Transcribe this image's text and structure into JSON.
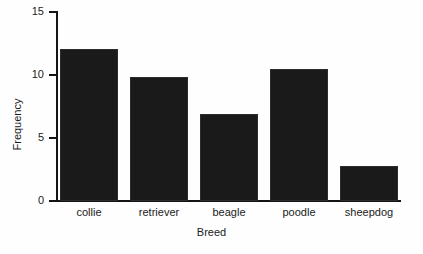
{
  "chart_data": {
    "type": "bar",
    "title": "",
    "xlabel": "Breed",
    "ylabel": "Frequency",
    "categories": [
      "collie",
      "retriever",
      "beagle",
      "poodle",
      "sheepdog"
    ],
    "values": [
      12,
      9.8,
      6.9,
      10.4,
      2.8
    ],
    "ylim": [
      0,
      15
    ],
    "y_ticks": [
      0,
      5,
      10,
      15
    ],
    "y_tick_labels": [
      "0",
      "5",
      "10",
      "15"
    ],
    "grid": false,
    "legend": null,
    "bar_color": "#1a1a1a",
    "axis_color": "#141414",
    "background_color": "#fefefe"
  },
  "axes": {
    "y_title": "Frequency",
    "x_title": "Breed",
    "y_tick_labels": [
      "15",
      "10",
      "5",
      "0"
    ]
  },
  "bars": [
    {
      "label": "collie",
      "value": 12,
      "value_label": "12"
    },
    {
      "label": "retriever",
      "value": 9.8,
      "value_label": "9.8"
    },
    {
      "label": "beagle",
      "value": 6.9,
      "value_label": "6.9"
    },
    {
      "label": "poodle",
      "value": 10.4,
      "value_label": "10.4"
    },
    {
      "label": "sheepdog",
      "value": 2.8,
      "value_label": "2.8"
    }
  ]
}
